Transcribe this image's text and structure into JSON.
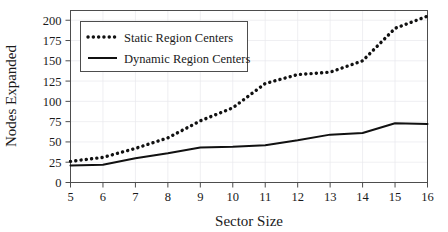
{
  "chart_data": {
    "type": "line",
    "title": "",
    "subtitle": "",
    "xlabel": "Sector Size",
    "ylabel": "Nodes Expanded",
    "x": [
      5,
      6,
      7,
      8,
      9,
      10,
      11,
      12,
      13,
      14,
      15,
      16
    ],
    "xlim": [
      5,
      16
    ],
    "ylim": [
      0,
      212
    ],
    "xticks": [
      5,
      6,
      7,
      8,
      9,
      10,
      11,
      12,
      13,
      14,
      15,
      16
    ],
    "xtick_labels": [
      "5",
      "6",
      "7",
      "8",
      "9",
      "10",
      "11",
      "12",
      "13",
      "14",
      "15",
      "16"
    ],
    "yticks": [
      0,
      25,
      50,
      75,
      100,
      125,
      150,
      175,
      200
    ],
    "ytick_labels": [
      "0",
      "25",
      "50",
      "75",
      "100",
      "125",
      "150",
      "175",
      "200"
    ],
    "grid": true,
    "legend_position": "upper left",
    "series": [
      {
        "name": "Static Region Centers",
        "style": "dotted",
        "color": "#111111",
        "values": [
          26,
          31,
          42,
          55,
          76,
          92,
          122,
          133,
          136,
          150,
          190,
          205
        ]
      },
      {
        "name": "Dynamic Region Centers",
        "style": "solid",
        "color": "#111111",
        "values": [
          21,
          22,
          30,
          36,
          43,
          44,
          46,
          52,
          59,
          61,
          73,
          72
        ]
      }
    ]
  },
  "legend": {
    "entries": [
      {
        "label": "Static Region Centers"
      },
      {
        "label": "Dynamic Region Centers"
      }
    ]
  },
  "axes": {
    "x_title": "Sector Size",
    "y_title": "Nodes Expanded"
  }
}
